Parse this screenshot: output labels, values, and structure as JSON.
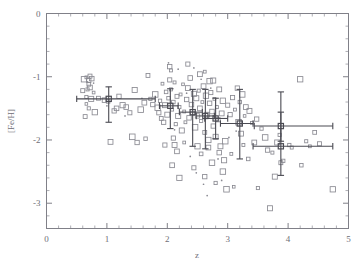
{
  "chart_data": {
    "type": "scatter",
    "title": "",
    "xlabel": "z",
    "ylabel": "[Fe/H]",
    "xlim": [
      0,
      5
    ],
    "ylim": [
      -3.4,
      0
    ],
    "grid": false,
    "legend": null,
    "x_ticks": [
      0,
      1,
      2,
      3,
      4,
      5
    ],
    "x_tick_labels": [
      "0",
      "1",
      "2",
      "3",
      "4",
      "5"
    ],
    "x_minor_step": 0.2,
    "y_ticks": [
      0,
      -1,
      -2,
      -3
    ],
    "y_tick_labels": [
      "0",
      "-1",
      "-2",
      "-3"
    ],
    "y_minor_step": 0.2,
    "series": [
      {
        "name": "individual absorbers",
        "marker": "open-square",
        "points": [
          [
            0.62,
            -1.04
          ],
          [
            0.66,
            -1.01
          ],
          [
            0.7,
            -1.06
          ],
          [
            0.7,
            -1.12
          ],
          [
            0.72,
            -0.99
          ],
          [
            0.75,
            -1.03
          ],
          [
            0.68,
            -1.2
          ],
          [
            0.72,
            -1.17
          ],
          [
            0.6,
            -1.22
          ],
          [
            0.78,
            -1.25
          ],
          [
            0.66,
            -1.32
          ],
          [
            0.74,
            -1.35
          ],
          [
            0.66,
            -1.43
          ],
          [
            0.7,
            -1.5
          ],
          [
            0.64,
            -1.63
          ],
          [
            0.8,
            -1.56
          ],
          [
            0.86,
            -1.34
          ],
          [
            0.96,
            -1.37
          ],
          [
            1.02,
            -1.39
          ],
          [
            1.06,
            -2.03
          ],
          [
            1.12,
            -1.54
          ],
          [
            1.16,
            -1.5
          ],
          [
            1.2,
            -1.31
          ],
          [
            1.26,
            -1.45
          ],
          [
            1.32,
            -1.48
          ],
          [
            1.38,
            -1.57
          ],
          [
            1.42,
            -1.95
          ],
          [
            1.46,
            -1.21
          ],
          [
            1.5,
            -2.04
          ],
          [
            1.56,
            -1.52
          ],
          [
            1.62,
            -1.41
          ],
          [
            1.64,
            -1.98
          ],
          [
            1.68,
            -0.98
          ],
          [
            1.72,
            -1.35
          ],
          [
            1.76,
            -1.44
          ],
          [
            1.8,
            -1.28
          ],
          [
            1.84,
            -1.49
          ],
          [
            1.86,
            -1.57
          ],
          [
            1.88,
            -1.38
          ],
          [
            1.9,
            -1.66
          ],
          [
            1.92,
            -1.11
          ],
          [
            1.94,
            -1.72
          ],
          [
            1.96,
            -1.45
          ],
          [
            1.98,
            -1.24
          ],
          [
            2.0,
            -1.6
          ],
          [
            2.02,
            -1.34
          ],
          [
            2.04,
            -1.05
          ],
          [
            2.06,
            -1.2
          ],
          [
            2.08,
            -1.52
          ],
          [
            2.1,
            -1.4
          ],
          [
            2.12,
            -1.09
          ],
          [
            2.14,
            -1.75
          ],
          [
            2.16,
            -1.31
          ],
          [
            2.04,
            -0.84
          ],
          [
            2.06,
            -0.9
          ],
          [
            2.1,
            -1.97
          ],
          [
            2.12,
            -2.08
          ],
          [
            2.16,
            -2.18
          ],
          [
            2.18,
            -1.62
          ],
          [
            2.2,
            -1.48
          ],
          [
            2.22,
            -1.28
          ],
          [
            2.24,
            -1.85
          ],
          [
            2.26,
            -1.12
          ],
          [
            2.28,
            -1.55
          ],
          [
            2.3,
            -1.72
          ],
          [
            2.32,
            -1.36
          ],
          [
            2.34,
            -1.18
          ],
          [
            2.36,
            -1.65
          ],
          [
            2.38,
            -1.02
          ],
          [
            2.4,
            -1.44
          ],
          [
            2.42,
            -1.58
          ],
          [
            2.44,
            -1.27
          ],
          [
            2.46,
            -1.8
          ],
          [
            2.48,
            -1.34
          ],
          [
            2.5,
            -1.62
          ],
          [
            2.52,
            -1.22
          ],
          [
            2.54,
            -1.5
          ],
          [
            2.56,
            -1.7
          ],
          [
            2.58,
            -1.4
          ],
          [
            2.6,
            -1.15
          ],
          [
            2.62,
            -1.88
          ],
          [
            2.64,
            -1.3
          ],
          [
            2.66,
            -1.6
          ],
          [
            2.68,
            -2.0
          ],
          [
            2.7,
            -1.42
          ],
          [
            2.72,
            -1.25
          ],
          [
            2.74,
            -1.55
          ],
          [
            2.76,
            -1.78
          ],
          [
            2.78,
            -1.35
          ],
          [
            2.8,
            -1.95
          ],
          [
            2.82,
            -1.48
          ],
          [
            2.84,
            -1.68
          ],
          [
            2.86,
            -1.2
          ],
          [
            2.88,
            -2.1
          ],
          [
            2.9,
            -1.58
          ],
          [
            2.92,
            -1.38
          ],
          [
            2.94,
            -2.32
          ],
          [
            2.96,
            -2.02
          ],
          [
            2.34,
            -0.8
          ],
          [
            2.54,
            -0.96
          ],
          [
            2.62,
            -0.92
          ],
          [
            2.7,
            -1.07
          ],
          [
            2.76,
            -1.06
          ],
          [
            2.44,
            -2.44
          ],
          [
            2.5,
            -2.1
          ],
          [
            2.56,
            -2.22
          ],
          [
            2.62,
            -2.58
          ],
          [
            2.68,
            -2.12
          ],
          [
            2.74,
            -2.36
          ],
          [
            2.8,
            -2.68
          ],
          [
            2.86,
            -2.2
          ],
          [
            2.92,
            -2.5
          ],
          [
            2.98,
            -2.78
          ],
          [
            3.0,
            -1.45
          ],
          [
            3.04,
            -1.6
          ],
          [
            3.08,
            -1.33
          ],
          [
            3.12,
            -1.52
          ],
          [
            3.16,
            -1.18
          ],
          [
            3.18,
            -1.72
          ],
          [
            3.2,
            -1.4
          ],
          [
            3.22,
            -1.9
          ],
          [
            3.24,
            -1.28
          ],
          [
            3.26,
            -2.08
          ],
          [
            3.28,
            -1.62
          ],
          [
            3.3,
            -1.48
          ],
          [
            3.34,
            -2.3
          ],
          [
            3.36,
            -1.54
          ],
          [
            3.4,
            -1.73
          ],
          [
            3.44,
            -2.04
          ],
          [
            3.48,
            -1.67
          ],
          [
            3.5,
            -2.76
          ],
          [
            3.56,
            -1.82
          ],
          [
            3.62,
            -1.96
          ],
          [
            3.66,
            -2.16
          ],
          [
            3.7,
            -3.08
          ],
          [
            3.74,
            -2.2
          ],
          [
            3.78,
            -2.58
          ],
          [
            3.82,
            -2.04
          ],
          [
            3.86,
            -1.92
          ],
          [
            3.88,
            -2.36
          ],
          [
            3.92,
            -2.33
          ],
          [
            4.02,
            -2.08
          ],
          [
            4.06,
            -2.12
          ],
          [
            4.2,
            -1.04
          ],
          [
            4.22,
            -2.4
          ],
          [
            4.3,
            -2.02
          ],
          [
            4.36,
            -2.1
          ],
          [
            4.44,
            -1.88
          ],
          [
            4.52,
            -2.06
          ],
          [
            4.74,
            -2.78
          ],
          [
            3.1,
            -2.74
          ],
          [
            3.06,
            -2.22
          ],
          [
            2.08,
            -2.4
          ],
          [
            1.96,
            -2.08
          ],
          [
            2.2,
            -2.6
          ],
          [
            2.28,
            -2.04
          ]
        ]
      },
      {
        "name": "small points",
        "marker": "dot",
        "points": [
          [
            0.68,
            -1.08
          ],
          [
            0.78,
            -1.1
          ],
          [
            1.0,
            -1.46
          ],
          [
            1.3,
            -1.62
          ],
          [
            1.58,
            -1.34
          ],
          [
            2.02,
            -0.78
          ],
          [
            2.18,
            -0.88
          ],
          [
            2.32,
            -1.26
          ],
          [
            2.48,
            -2.52
          ],
          [
            2.6,
            -2.7
          ],
          [
            2.66,
            -2.88
          ],
          [
            2.84,
            -2.3
          ],
          [
            2.9,
            -2.64
          ],
          [
            3.02,
            -1.96
          ],
          [
            3.14,
            -1.86
          ],
          [
            2.44,
            -0.86
          ],
          [
            2.72,
            -1.18
          ],
          [
            2.12,
            -1.84
          ],
          [
            2.38,
            -2.26
          ],
          [
            2.56,
            -1.04
          ]
        ]
      }
    ],
    "binned_series": {
      "name": "binned means with errors",
      "points": [
        {
          "x": 1.03,
          "y": -1.35,
          "x_lo": 0.5,
          "x_hi": 1.8,
          "y_lo": -1.72,
          "y_hi": -1.16
        },
        {
          "x": 2.05,
          "y": -1.46,
          "x_lo": 1.87,
          "x_hi": 2.18,
          "y_lo": -1.82,
          "y_hi": -1.19
        },
        {
          "x": 2.42,
          "y": -1.56,
          "x_lo": 2.2,
          "x_hi": 2.58,
          "y_lo": -2.1,
          "y_hi": -1.2
        },
        {
          "x": 2.63,
          "y": -1.62,
          "x_lo": 2.48,
          "x_hi": 2.78,
          "y_lo": -2.14,
          "y_hi": -1.2
        },
        {
          "x": 2.8,
          "y": -1.66,
          "x_lo": 2.62,
          "x_hi": 3.0,
          "y_lo": -1.98,
          "y_hi": -1.34
        },
        {
          "x": 3.2,
          "y": -1.74,
          "x_lo": 2.88,
          "x_hi": 3.42,
          "y_lo": -2.3,
          "y_hi": -1.2
        },
        {
          "x": 3.88,
          "y": -1.78,
          "x_lo": 3.44,
          "x_hi": 4.74,
          "y_lo": -2.02,
          "y_hi": -1.24
        },
        {
          "x": 3.88,
          "y": -2.1,
          "x_lo": 3.42,
          "x_hi": 4.74,
          "y_lo": -2.56,
          "y_hi": -1.56
        }
      ]
    },
    "colors": {
      "axis": "#808088",
      "marker": "#8a8a92",
      "binned": "#4a4a52",
      "background": "#ffffff"
    }
  }
}
